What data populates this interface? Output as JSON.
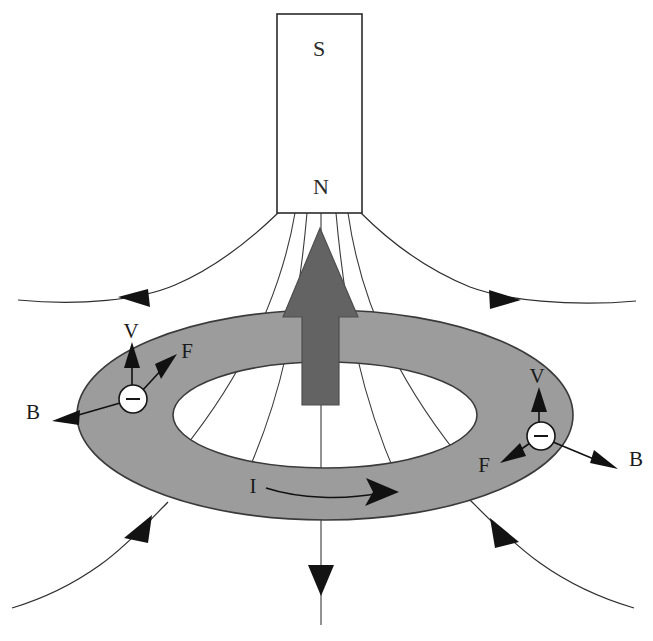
{
  "figure": {
    "background_color": "#ffffff"
  },
  "magnet": {
    "name": "bar-magnet",
    "top_pole_label": "S",
    "bottom_pole_label": "N",
    "fill_color": "#ffffff",
    "stroke_color": "#2b2b2b"
  },
  "ring": {
    "name": "conducting-ring",
    "fill_color": "#9c9c9c",
    "stroke_color": "#3a3a3a"
  },
  "motion_arrow": {
    "name": "magnet-motion-arrow",
    "direction": "up",
    "fill_color": "#636363",
    "stroke_color": "#4a4a4a"
  },
  "current": {
    "label": "I",
    "direction": "clockwise-front-to-right"
  },
  "charges": [
    {
      "id": "left-charge",
      "sign": "−",
      "velocity_label": "V",
      "force_label": "F",
      "field_label": "B"
    },
    {
      "id": "right-charge",
      "sign": "−",
      "velocity_label": "V",
      "force_label": "F",
      "field_label": "B"
    }
  ],
  "field_lines": {
    "name": "magnetic-field-lines",
    "count": 9,
    "arrow_count": 5,
    "stroke_color": "#2e2e2e"
  }
}
